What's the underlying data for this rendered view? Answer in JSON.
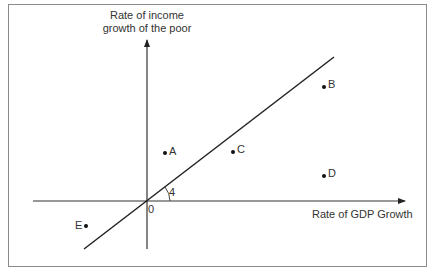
{
  "diagram": {
    "y_axis_label": "Rate of income growth of the poor",
    "y_axis_label_line1": "Rate of income",
    "y_axis_label_line2": "growth of the poor",
    "x_axis_label": "Rate of GDP Growth",
    "origin_label": "0",
    "angle_label": "4",
    "points": [
      {
        "label": "A",
        "x": 165,
        "y": 153
      },
      {
        "label": "B",
        "x": 324,
        "y": 87
      },
      {
        "label": "C",
        "x": 233,
        "y": 152
      },
      {
        "label": "D",
        "x": 324,
        "y": 176
      },
      {
        "label": "E",
        "x": 86,
        "y": 226
      }
    ],
    "colors": {
      "line": "#222222",
      "frame": "#8a8a8a",
      "text": "#333333"
    }
  }
}
